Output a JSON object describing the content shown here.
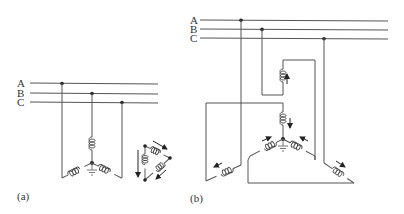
{
  "figure": {
    "colors": {
      "wire": "#555555",
      "coil": "#444444",
      "node": "#222222",
      "text": "#333333",
      "background": "#ffffff"
    }
  },
  "panel_a": {
    "caption": "(a)",
    "bus_labels": [
      "A",
      "B",
      "C"
    ],
    "description": "Wye-connected windings with grounded neutral tapped from three-phase bus A, B, C; equivalent delta with circulating current arrows"
  },
  "panel_b": {
    "caption": "(b)",
    "bus_labels": [
      "A",
      "B",
      "C"
    ],
    "description": "Zigzag (interconnected star) grounding transformer connected to three-phase bus A, B, C with current direction arrows"
  }
}
